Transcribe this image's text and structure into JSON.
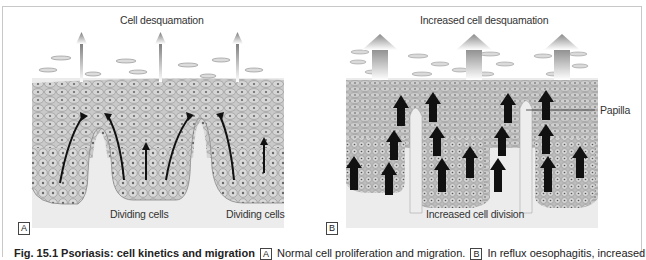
{
  "figure": {
    "panels": [
      {
        "id": "A",
        "title": "Cell desquamation",
        "bottom_labels": [
          "Dividing cells",
          "Dividing cells"
        ],
        "arrow_style": "thin"
      },
      {
        "id": "B",
        "title": "Increased cell desquamation",
        "side_label": "Papilla",
        "bottom_labels": [
          "Increased cell division"
        ],
        "arrow_style": "thick"
      }
    ],
    "caption": {
      "prefix_bold": "Fig. 15.1  Psoriasis: cell kinetics and migration",
      "part_a_marker": "A",
      "part_a_text": "Normal cell proliferation and migration.",
      "part_b_marker": "B",
      "part_b_text": "In reflux oesophagitis, increased"
    },
    "colors": {
      "epidermis": "#bdbdbd",
      "dermis": "#ececec",
      "arrow_dark": "#111111",
      "arrow_grey": "#8a8a8a",
      "frame": "#c8c8c8"
    }
  }
}
